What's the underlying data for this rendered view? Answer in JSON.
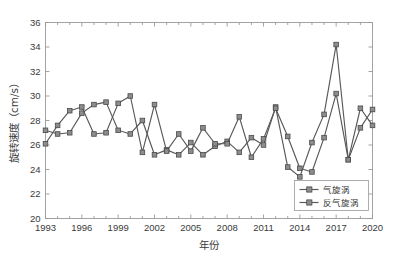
{
  "chart_data": {
    "type": "line",
    "title": "",
    "xlabel": "年份",
    "ylabel": "旋转速度（cm/s）",
    "xlim": [
      1993,
      2020
    ],
    "ylim": [
      20,
      36
    ],
    "yticks": [
      20,
      22,
      24,
      26,
      28,
      30,
      32,
      34,
      36
    ],
    "xticks": [
      1993,
      1996,
      1999,
      2002,
      2005,
      2008,
      2011,
      2014,
      2017,
      2020
    ],
    "grid": false,
    "legend_position": "lower-right",
    "marker": "square",
    "line_color": "#585858",
    "marker_fill": "#8d8d8d",
    "marker_edge": "#4a4a4a",
    "x": [
      1993,
      1994,
      1995,
      1996,
      1997,
      1998,
      1999,
      2000,
      2001,
      2002,
      2003,
      2004,
      2005,
      2006,
      2007,
      2008,
      2009,
      2010,
      2011,
      2012,
      2013,
      2014,
      2015,
      2016,
      2017,
      2018,
      2019,
      2020
    ],
    "series": [
      {
        "name": "气旋涡",
        "values": [
          27.2,
          26.9,
          27.0,
          28.6,
          29.3,
          29.5,
          27.2,
          26.9,
          28.0,
          25.2,
          25.6,
          25.2,
          26.2,
          25.2,
          25.9,
          26.3,
          25.4,
          26.6,
          26.0,
          29.1,
          24.2,
          23.4,
          26.2,
          28.5,
          34.2,
          24.8,
          27.4,
          28.9
        ]
      },
      {
        "name": "反气旋涡",
        "values": [
          26.1,
          27.6,
          28.8,
          29.1,
          26.9,
          27.0,
          29.4,
          30.0,
          25.4,
          29.3,
          25.5,
          26.9,
          25.5,
          27.4,
          26.1,
          26.1,
          28.3,
          25.0,
          26.5,
          29.0,
          26.7,
          24.1,
          23.8,
          26.6,
          30.2,
          24.8,
          29.0,
          27.6
        ]
      }
    ]
  },
  "legend": {
    "items": [
      {
        "label": "气旋涡"
      },
      {
        "label": "反气旋涡"
      }
    ]
  },
  "axes": {
    "y_tick_labels": [
      "20",
      "22",
      "24",
      "26",
      "28",
      "30",
      "32",
      "34",
      "36"
    ],
    "x_tick_labels": [
      "1993",
      "1996",
      "1999",
      "2002",
      "2005",
      "2008",
      "2011",
      "2014",
      "2017",
      "2020"
    ],
    "y_axis_title": "旋转速度（cm/s）",
    "x_axis_title": "年份"
  }
}
